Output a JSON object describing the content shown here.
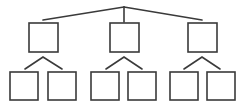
{
  "diagram": {
    "type": "tree",
    "title": "",
    "colors": {
      "stroke": "#3a3a3a",
      "fill": "#ffffff",
      "background": "#ffffff"
    },
    "root_junction": {
      "x": 124,
      "y": 7
    },
    "root_edges": [
      {
        "x1": 124,
        "y1": 7,
        "x2": 43,
        "y2": 20
      },
      {
        "x1": 124,
        "y1": 7,
        "x2": 124,
        "y2": 22
      },
      {
        "x1": 124,
        "y1": 7,
        "x2": 202,
        "y2": 20
      }
    ],
    "level1": [
      {
        "id": "n1",
        "label": "",
        "x": 29,
        "y": 23,
        "w": 29,
        "h": 29
      },
      {
        "id": "n2",
        "label": "",
        "x": 110,
        "y": 23,
        "w": 29,
        "h": 29
      },
      {
        "id": "n3",
        "label": "",
        "x": 188,
        "y": 23,
        "w": 29,
        "h": 29
      }
    ],
    "branches": [
      {
        "apex": {
          "x": 43,
          "y": 57
        },
        "left": {
          "x": 25,
          "y": 69
        },
        "right": {
          "x": 62,
          "y": 69
        }
      },
      {
        "apex": {
          "x": 124,
          "y": 57
        },
        "left": {
          "x": 106,
          "y": 69
        },
        "right": {
          "x": 142,
          "y": 69
        }
      },
      {
        "apex": {
          "x": 202,
          "y": 57
        },
        "left": {
          "x": 184,
          "y": 69
        },
        "right": {
          "x": 220,
          "y": 69
        }
      }
    ],
    "level2": [
      {
        "id": "n1a",
        "label": "",
        "x": 10,
        "y": 72,
        "w": 28,
        "h": 28
      },
      {
        "id": "n1b",
        "label": "",
        "x": 48,
        "y": 72,
        "w": 28,
        "h": 28
      },
      {
        "id": "n2a",
        "label": "",
        "x": 91,
        "y": 72,
        "w": 28,
        "h": 28
      },
      {
        "id": "n2b",
        "label": "",
        "x": 128,
        "y": 72,
        "w": 28,
        "h": 28
      },
      {
        "id": "n3a",
        "label": "",
        "x": 170,
        "y": 72,
        "w": 28,
        "h": 28
      },
      {
        "id": "n3b",
        "label": "",
        "x": 207,
        "y": 72,
        "w": 28,
        "h": 28
      }
    ]
  }
}
